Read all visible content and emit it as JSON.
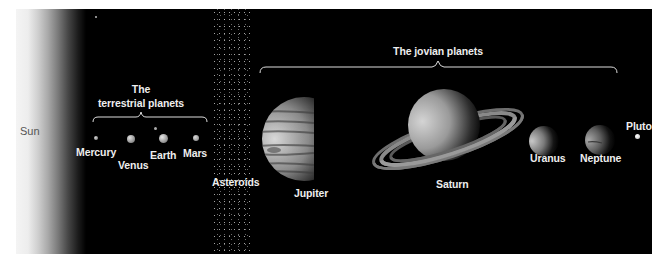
{
  "figure": {
    "background_color": "#000000",
    "label_color": "#eeeeee"
  },
  "sun": {
    "label": "Sun"
  },
  "groups": {
    "terrestrial": {
      "label_line1": "The",
      "label_line2": "terrestrial planets"
    },
    "jovian": {
      "label": "The jovian planets"
    }
  },
  "asteroids": {
    "label": "Asteroids"
  },
  "planets": [
    {
      "name": "Mercury"
    },
    {
      "name": "Venus"
    },
    {
      "name": "Earth"
    },
    {
      "name": "Mars"
    },
    {
      "name": "Jupiter"
    },
    {
      "name": "Saturn"
    },
    {
      "name": "Uranus"
    },
    {
      "name": "Neptune"
    },
    {
      "name": "Pluto"
    }
  ]
}
